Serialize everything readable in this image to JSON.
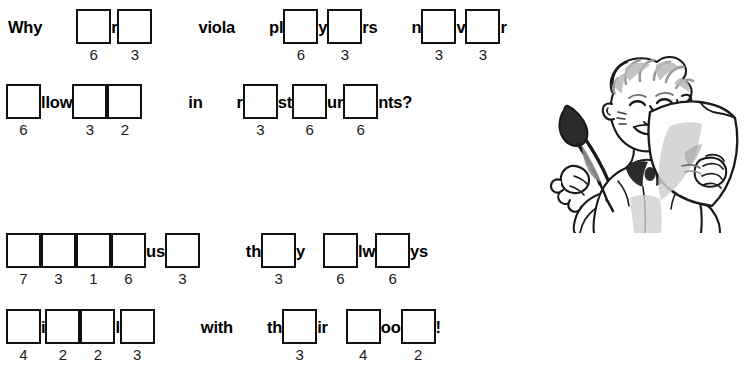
{
  "worksheet": {
    "type": "fill-in-the-blank riddle puzzle",
    "lines": [
      {
        "id": "line-1",
        "top": 8,
        "left": 8,
        "tokens": [
          {
            "kind": "text",
            "text": "Why"
          },
          {
            "kind": "gap",
            "size": "lg"
          },
          {
            "kind": "box",
            "clue": "6"
          },
          {
            "kind": "text",
            "text": "r"
          },
          {
            "kind": "box",
            "clue": "3"
          },
          {
            "kind": "gap",
            "size": "xl"
          },
          {
            "kind": "text",
            "text": "viola"
          },
          {
            "kind": "gap",
            "size": "lg"
          },
          {
            "kind": "text",
            "text": "pl"
          },
          {
            "kind": "box",
            "clue": "6"
          },
          {
            "kind": "text",
            "text": "y"
          },
          {
            "kind": "box",
            "clue": "3"
          },
          {
            "kind": "text",
            "text": "rs"
          },
          {
            "kind": "gap",
            "size": "lg"
          },
          {
            "kind": "text",
            "text": "n"
          },
          {
            "kind": "box",
            "clue": "3"
          },
          {
            "kind": "text",
            "text": "v"
          },
          {
            "kind": "box",
            "clue": "3"
          },
          {
            "kind": "text",
            "text": "r"
          }
        ]
      },
      {
        "id": "line-2",
        "top": 83,
        "left": 6,
        "tokens": [
          {
            "kind": "box",
            "clue": "6"
          },
          {
            "kind": "text",
            "text": "llow"
          },
          {
            "kind": "box",
            "clue": "3"
          },
          {
            "kind": "box",
            "clue": "2"
          },
          {
            "kind": "gap",
            "size": "xl"
          },
          {
            "kind": "text",
            "text": "in"
          },
          {
            "kind": "gap",
            "size": "lg"
          },
          {
            "kind": "text",
            "text": "r"
          },
          {
            "kind": "box",
            "clue": "3"
          },
          {
            "kind": "text",
            "text": "st"
          },
          {
            "kind": "box",
            "clue": "6"
          },
          {
            "kind": "text",
            "text": "ur"
          },
          {
            "kind": "box",
            "clue": "6"
          },
          {
            "kind": "text",
            "text": "nts?"
          }
        ]
      },
      {
        "id": "line-3",
        "top": 232,
        "left": 6,
        "tokens": [
          {
            "kind": "box",
            "clue": "7"
          },
          {
            "kind": "box",
            "clue": "3"
          },
          {
            "kind": "box",
            "clue": "1"
          },
          {
            "kind": "box",
            "clue": "6"
          },
          {
            "kind": "text",
            "text": "us"
          },
          {
            "kind": "box",
            "clue": "3"
          },
          {
            "kind": "gap",
            "size": "xl"
          },
          {
            "kind": "text",
            "text": "th"
          },
          {
            "kind": "box",
            "clue": "3"
          },
          {
            "kind": "text",
            "text": "y"
          },
          {
            "kind": "gap",
            "size": "md"
          },
          {
            "kind": "box",
            "clue": "6"
          },
          {
            "kind": "text",
            "text": "lw"
          },
          {
            "kind": "box",
            "clue": "6"
          },
          {
            "kind": "text",
            "text": "ys"
          }
        ]
      },
      {
        "id": "line-4",
        "top": 308,
        "left": 6,
        "tokens": [
          {
            "kind": "box",
            "clue": "4"
          },
          {
            "kind": "text",
            "text": "i"
          },
          {
            "kind": "box",
            "clue": "2"
          },
          {
            "kind": "box",
            "clue": "2"
          },
          {
            "kind": "text",
            "text": "l"
          },
          {
            "kind": "box",
            "clue": "3"
          },
          {
            "kind": "gap",
            "size": "xl"
          },
          {
            "kind": "text",
            "text": "with"
          },
          {
            "kind": "gap",
            "size": "lg"
          },
          {
            "kind": "text",
            "text": "th"
          },
          {
            "kind": "box",
            "clue": "3"
          },
          {
            "kind": "text",
            "text": "ir"
          },
          {
            "kind": "gap",
            "size": "md"
          },
          {
            "kind": "box",
            "clue": "4"
          },
          {
            "kind": "text",
            "text": "oo"
          },
          {
            "kind": "box",
            "clue": "2"
          },
          {
            "kind": "text",
            "text": "!"
          }
        ]
      }
    ]
  },
  "illustration": {
    "name": "boy-with-pen-and-paper",
    "description": "Cartoon line drawing of a boy with spiky hair holding a large pen in his right hand and a sheet of paper in his left hand",
    "ink_color": "#1a1a1a",
    "shade_color": "#b9b9b9",
    "light_shade_color": "#d8d8d8"
  }
}
